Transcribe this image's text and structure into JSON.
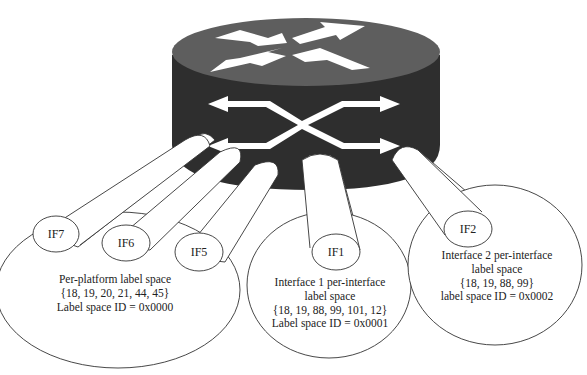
{
  "diagram": {
    "type": "router-label-spaces",
    "colors": {
      "router_top": "#5e5e5e",
      "router_side": "#2e2e2e",
      "arrows": "#ffffff",
      "outline": "#333333"
    },
    "router": {
      "name": "router-icon"
    },
    "interfaces": {
      "if7": "IF7",
      "if6": "IF6",
      "if5": "IF5",
      "if1": "IF1",
      "if2": "IF2"
    },
    "spaces": {
      "platform": {
        "line1": "Per-platform label space",
        "line2": "{18, 19, 20, 21, 44, 45}",
        "line3": "Label space ID = 0x0000"
      },
      "interface1": {
        "line1": "Interface 1 per-interface",
        "line2": "label space",
        "line3": "{18, 19, 88, 99, 101, 12}",
        "line4": "Label space ID = 0x0001"
      },
      "interface2": {
        "line1": "Interface 2 per-interface",
        "line2": "label space",
        "line3": "{18, 19, 88, 99}",
        "line4": "label space ID = 0x0002"
      }
    }
  }
}
